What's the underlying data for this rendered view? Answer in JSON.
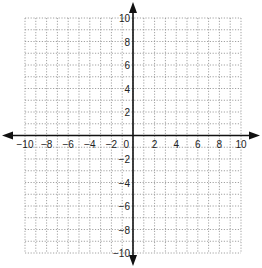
{
  "diagram": {
    "type": "coordinate-plane",
    "x_range": [
      -10,
      10
    ],
    "y_range": [
      -10,
      10
    ],
    "grid_step": 1,
    "label_step": 2,
    "grid_style": "dotted",
    "axes_arrows": true,
    "origin_label": "0",
    "x_tick_labels": [
      "-10",
      "-8",
      "-6",
      "-4",
      "-2",
      "2",
      "4",
      "6",
      "8",
      "10"
    ],
    "y_tick_labels": [
      "10",
      "8",
      "6",
      "4",
      "2",
      "-2",
      "-4",
      "-6",
      "-8",
      "-10"
    ],
    "colors": {
      "axis": "#111111",
      "grid": "#8a8a8a",
      "label": "#222222",
      "background": "#ffffff"
    }
  }
}
